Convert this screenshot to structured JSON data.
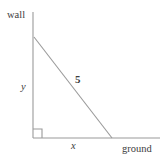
{
  "figure": {
    "type": "geometry-diagram",
    "labels": {
      "wall": "wall",
      "ground": "ground",
      "vertical_leg": "y",
      "horizontal_leg": "x",
      "hypotenuse": "5"
    },
    "colors": {
      "line": "#9a9a9a",
      "text": "#3d3d3d",
      "background": "#ffffff"
    },
    "geometry": {
      "wall_line": {
        "x1": 33,
        "y1": 12,
        "x2": 33,
        "y2": 138
      },
      "ground_line": {
        "x1": 33,
        "y1": 138,
        "x2": 160,
        "y2": 138
      },
      "ladder_line": {
        "x1": 34,
        "y1": 37,
        "x2": 112,
        "y2": 138
      },
      "right_angle_marker": {
        "x": 33,
        "y": 138,
        "size": 9
      }
    }
  }
}
